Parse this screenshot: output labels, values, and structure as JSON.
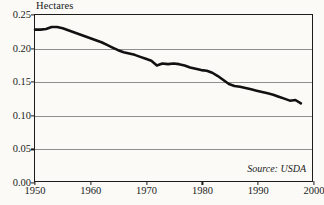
{
  "chart_data": {
    "type": "line",
    "title": "",
    "subtitle": "",
    "xlabel": "",
    "ylabel": "Hectares",
    "ylabel_position": "above-axis-top-left",
    "xlim": [
      1950,
      2000
    ],
    "ylim": [
      0.0,
      0.25
    ],
    "grid": true,
    "grid_axis": "y",
    "legend": false,
    "legend_position": "none",
    "annotations": [
      {
        "name": "source-note",
        "text": "Source: USDA",
        "position": "bottom-right-inside-plot",
        "style": "italic"
      }
    ],
    "ytick_labels": [
      "0.00",
      "0.05",
      "0.10",
      "0.15",
      "0.20",
      "0.25"
    ],
    "ytick_values": [
      0.0,
      0.05,
      0.1,
      0.15,
      0.2,
      0.25
    ],
    "xtick_labels": [
      "1950",
      "1960",
      "1970",
      "1980",
      "1990",
      "2000"
    ],
    "xtick_values": [
      1950,
      1960,
      1970,
      1980,
      1990,
      2000
    ],
    "series": [
      {
        "name": "Grain area per person",
        "color": "#111111",
        "line_width": 2.6,
        "x": [
          1950,
          1951,
          1952,
          1953,
          1954,
          1955,
          1956,
          1957,
          1958,
          1959,
          1960,
          1961,
          1962,
          1963,
          1964,
          1965,
          1966,
          1967,
          1968,
          1969,
          1970,
          1971,
          1972,
          1973,
          1974,
          1975,
          1976,
          1977,
          1978,
          1979,
          1980,
          1981,
          1982,
          1983,
          1984,
          1985,
          1986,
          1987,
          1988,
          1989,
          1990,
          1991,
          1992,
          1993,
          1994,
          1995,
          1996,
          1997,
          1998
        ],
        "values": [
          0.228,
          0.228,
          0.229,
          0.232,
          0.232,
          0.23,
          0.227,
          0.224,
          0.221,
          0.218,
          0.215,
          0.212,
          0.209,
          0.205,
          0.201,
          0.197,
          0.194,
          0.192,
          0.19,
          0.187,
          0.184,
          0.181,
          0.174,
          0.177,
          0.176,
          0.177,
          0.176,
          0.174,
          0.171,
          0.169,
          0.167,
          0.166,
          0.163,
          0.158,
          0.152,
          0.146,
          0.143,
          0.142,
          0.14,
          0.138,
          0.136,
          0.134,
          0.132,
          0.13,
          0.127,
          0.124,
          0.121,
          0.122,
          0.117
        ]
      }
    ]
  },
  "figure": {
    "background_color": "#fbfaf7",
    "axis_color": "#1c1c1c",
    "grid_color": "#8e8e8e",
    "text_color": "#1a1a1a"
  }
}
